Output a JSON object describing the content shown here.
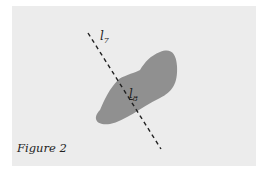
{
  "figure": {
    "caption": "Figure 2",
    "labels": {
      "l7": {
        "main": "l",
        "sub": "7"
      },
      "l8": {
        "main": "l",
        "sub": "8"
      }
    },
    "colors": {
      "panel": "#ececec",
      "blob": "#909090",
      "line": "#222222"
    }
  }
}
